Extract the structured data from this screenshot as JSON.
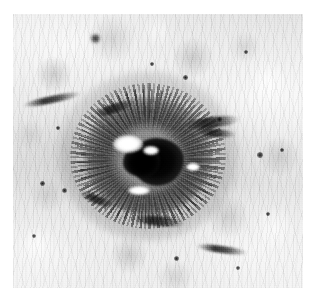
{
  "page": {
    "background_color": "#ffffff",
    "width": 315,
    "height": 300
  },
  "figure": {
    "name": "grayscale-micrograph",
    "caption": "",
    "alt_text": "Grayscale photograph of a crater-like pit with a dark central core surrounded by radial streaks on a mottled light-gray textured surface",
    "plate": {
      "x": 13,
      "y": 14,
      "width": 290,
      "height": 274,
      "border_color": "none",
      "background_color": "#d8d8d8"
    },
    "tone": {
      "background_light": "#f2f2f2",
      "background_mid": "#d2d2d2",
      "background_dark": "#8c8c8c",
      "core_black": "#050505",
      "highlight_white": "#ffffff"
    },
    "subject": {
      "label": "central crater lesion",
      "center_x": 148,
      "center_y": 156,
      "width": 128,
      "height": 118
    },
    "core": {
      "label": "dark central pit",
      "center_x": 158,
      "center_y": 162,
      "width": 52,
      "height": 48
    },
    "highlights": [
      {
        "label": "pit-highlight-upper-left",
        "x": 113,
        "y": 135,
        "width": 30,
        "height": 18
      },
      {
        "label": "pit-highlight-inner",
        "x": 143,
        "y": 146,
        "width": 16,
        "height": 9
      },
      {
        "label": "rim-highlight-lower",
        "x": 128,
        "y": 186,
        "width": 22,
        "height": 9
      },
      {
        "label": "rim-highlight-right",
        "x": 186,
        "y": 163,
        "width": 14,
        "height": 8
      }
    ],
    "streaks": [
      {
        "label": "lateral-streak-right",
        "x": 184,
        "y": 117,
        "width": 56,
        "height": 11,
        "rotation": -7
      },
      {
        "label": "lateral-streak-right-lower",
        "x": 196,
        "y": 129,
        "width": 40,
        "height": 8,
        "rotation": 5
      },
      {
        "label": "rim-streak-upper-left",
        "x": 92,
        "y": 104,
        "width": 44,
        "height": 9,
        "rotation": -18
      },
      {
        "label": "rim-streak-lower-left",
        "x": 78,
        "y": 196,
        "width": 40,
        "height": 8,
        "rotation": 22
      },
      {
        "label": "rim-streak-lower",
        "x": 132,
        "y": 216,
        "width": 54,
        "height": 10,
        "rotation": 6
      },
      {
        "label": "background-streak-left",
        "x": 22,
        "y": 96,
        "width": 60,
        "height": 7,
        "rotation": -12
      },
      {
        "label": "background-streak-bottom",
        "x": 196,
        "y": 246,
        "width": 52,
        "height": 7,
        "rotation": 8
      }
    ],
    "specks": [
      {
        "label": "speck-top",
        "x": 95,
        "y": 38,
        "size": 9
      },
      {
        "label": "speck-upper-right",
        "x": 185,
        "y": 77,
        "size": 5
      },
      {
        "label": "speck-right-upper",
        "x": 219,
        "y": 119,
        "size": 5
      },
      {
        "label": "speck-right",
        "x": 260,
        "y": 155,
        "size": 6
      },
      {
        "label": "speck-right-far",
        "x": 282,
        "y": 150,
        "size": 4
      },
      {
        "label": "speck-left",
        "x": 42,
        "y": 183,
        "size": 5
      },
      {
        "label": "speck-left-lower",
        "x": 64,
        "y": 190,
        "size": 5
      },
      {
        "label": "speck-bottom-left",
        "x": 34,
        "y": 236,
        "size": 4
      },
      {
        "label": "speck-bottom",
        "x": 176,
        "y": 258,
        "size": 5
      },
      {
        "label": "speck-bottom-right",
        "x": 238,
        "y": 268,
        "size": 4
      },
      {
        "label": "speck-top-right",
        "x": 246,
        "y": 52,
        "size": 4
      },
      {
        "label": "speck-upper-mid",
        "x": 152,
        "y": 64,
        "size": 4
      },
      {
        "label": "speck-lower-right",
        "x": 268,
        "y": 214,
        "size": 4
      },
      {
        "label": "speck-mid-left",
        "x": 58,
        "y": 128,
        "size": 4
      }
    ]
  }
}
